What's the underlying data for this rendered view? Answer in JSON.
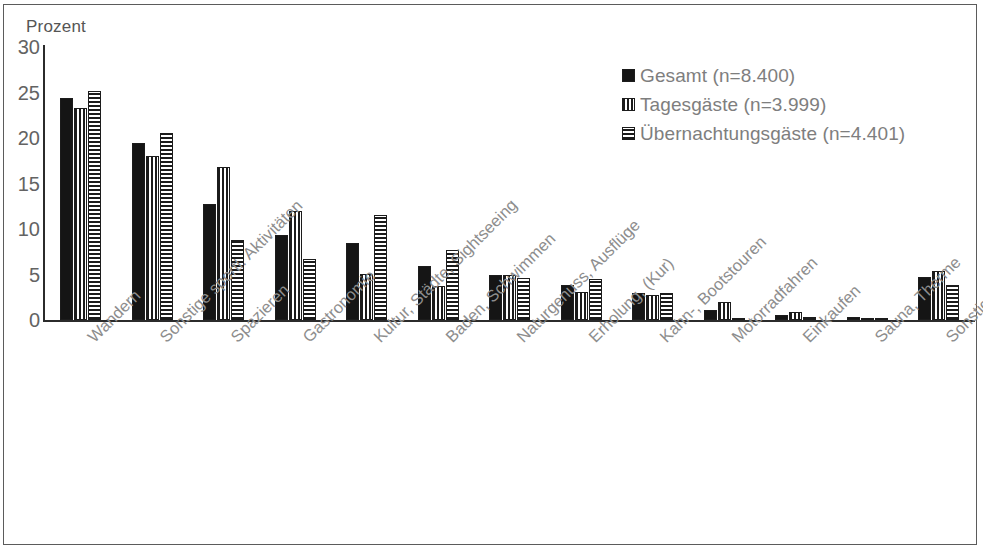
{
  "chart_data": {
    "type": "bar",
    "title": "",
    "subtitle": "",
    "xlabel": "",
    "ylabel": "Prozent",
    "ylim": [
      0,
      30
    ],
    "yticks": [
      0,
      5,
      10,
      15,
      20,
      25,
      30
    ],
    "grid": false,
    "legend_position": "top-right",
    "categories": [
      "Wandern",
      "Sonstige sportl. Aktivitäten",
      "Spazieren",
      "Gastronomie",
      "Kultur, Städte, Sightseeing",
      "Baden, Schwimmen",
      "Naturgenuss, Ausflüge",
      "Erholung, (Kur)",
      "Kahn-, Bootstouren",
      "Motorradfahren",
      "Einkaufen",
      "Sauna, Therme",
      "Sonstiges"
    ],
    "series": [
      {
        "name": "Gesamt (n=8.400)",
        "pattern": "solid",
        "values": [
          24.4,
          19.5,
          12.8,
          9.3,
          8.5,
          5.9,
          5.0,
          3.9,
          3.0,
          1.1,
          0.6,
          0.3,
          4.7
        ]
      },
      {
        "name": "Tagesgäste  (n=3.999)",
        "pattern": "vertical-stripes",
        "values": [
          23.3,
          18.0,
          16.8,
          12.0,
          5.1,
          3.7,
          5.0,
          3.1,
          2.8,
          2.0,
          0.9,
          0.2,
          5.4
        ]
      },
      {
        "name": "Übernachtungsgäste (n=4.401)",
        "pattern": "horizontal-stripes",
        "values": [
          25.2,
          20.6,
          8.8,
          6.7,
          11.5,
          7.7,
          4.6,
          4.5,
          3.0,
          0.2,
          0.3,
          0.2,
          3.8
        ]
      }
    ]
  },
  "colors": {
    "series_solid": "#151515",
    "stripe": "#1b1b1b",
    "axis": "#2b2b2b",
    "tick_text": "#636363",
    "label_text": "#8d8d8d",
    "legend_text": "#7e7e7e",
    "frame": "#5b5b5b",
    "background": "#ffffff"
  }
}
